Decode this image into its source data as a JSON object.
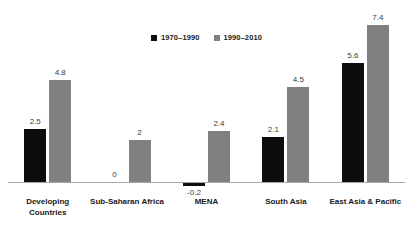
{
  "chart_data": {
    "type": "bar",
    "title": "",
    "subtitle": "",
    "xlabel": "",
    "ylabel": "",
    "ylim": [
      -0.5,
      8
    ],
    "grid": false,
    "legend_position": "top-center",
    "categories": [
      "Developing\nCountries",
      "Sub-Saharan Africa",
      "MENA",
      "South Asia",
      "East Asia & Pacific"
    ],
    "series": [
      {
        "name": "1970–1990",
        "color": "#0d0d0d",
        "values": [
          2.5,
          0,
          -0.2,
          2.1,
          5.6
        ],
        "labels": [
          "2.5",
          "0",
          "-0.2",
          "2.1",
          "5.6"
        ]
      },
      {
        "name": "1990–2010",
        "color": "#808080",
        "values": [
          4.8,
          2,
          2.4,
          4.5,
          7.4
        ],
        "labels": [
          "4.8",
          "2",
          "2.4",
          "4.5",
          "7.4"
        ]
      }
    ],
    "axis_color": "#a6a6a6",
    "background": "#ffffff"
  }
}
